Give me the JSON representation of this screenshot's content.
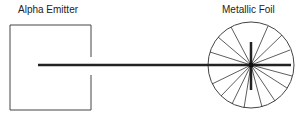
{
  "labels": {
    "emitter": "Alpha Emitter",
    "foil": "Metallic Foil"
  },
  "colors": {
    "line": "#333333",
    "beam": "#222222",
    "background": "#ffffff"
  },
  "diagram": {
    "emitter_box": {
      "x": 10,
      "y": 25,
      "width": 81,
      "height": 85,
      "slit": [
        58,
        76
      ]
    },
    "beam": {
      "x1": 38,
      "x2": 251,
      "y": 65
    },
    "foil_circle": {
      "cx": 251,
      "cy": 65,
      "r": 43
    },
    "scatter_lines": 16
  }
}
